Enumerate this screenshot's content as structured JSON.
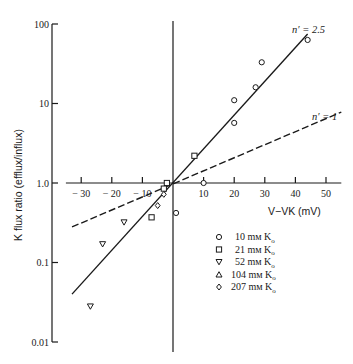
{
  "chart_data": {
    "type": "scatter",
    "title": "",
    "xlabel": "V−VK (mV)",
    "ylabel": "K flux ratio (efflux/influx)",
    "yscale": "log",
    "xlim": [
      -35,
      55
    ],
    "ylim": [
      0.01,
      100
    ],
    "x_ticks": [
      -30,
      -20,
      -10,
      10,
      20,
      30,
      40,
      50
    ],
    "x_tick_labels": [
      "− 30",
      "− 20",
      "− 10",
      "10",
      "20",
      "30",
      "40",
      "50"
    ],
    "y_ticks": [
      0.01,
      0.1,
      1.0,
      10,
      100
    ],
    "y_tick_labels": [
      "0.01",
      "0.1",
      "1.0",
      "10",
      "100"
    ],
    "grid": false,
    "legend_position": "lower right",
    "series": [
      {
        "name": "10 mM Ko",
        "label": "10 mм K",
        "sub": "o",
        "marker": "circle",
        "points": [
          [
            44,
            63
          ],
          [
            29,
            33
          ],
          [
            27,
            16
          ],
          [
            20,
            11
          ],
          [
            20,
            5.7
          ],
          [
            10,
            1.0
          ],
          [
            1,
            0.42
          ]
        ]
      },
      {
        "name": "21 mM Ko",
        "label": "21 mм K",
        "sub": "o",
        "marker": "square",
        "points": [
          [
            7,
            2.2
          ],
          [
            -2,
            1.0
          ],
          [
            -3,
            0.85
          ],
          [
            -7,
            0.37
          ]
        ]
      },
      {
        "name": "52 mM Ko",
        "label": "52 mм K",
        "sub": "o",
        "marker": "triangle-down",
        "points": [
          [
            -16,
            0.32
          ],
          [
            -23,
            0.17
          ],
          [
            -27,
            0.028
          ]
        ]
      },
      {
        "name": "104 mM Ko",
        "label": "104 mм K",
        "sub": "o",
        "marker": "triangle-up",
        "points": []
      },
      {
        "name": "207 mM Ko",
        "label": "207 mм K",
        "sub": "o",
        "marker": "diamond",
        "points": [
          [
            -5,
            0.52
          ],
          [
            -3,
            0.72
          ]
        ]
      }
    ],
    "lines": [
      {
        "name": "n' = 2.5",
        "style": "solid",
        "x": [
          -33,
          44
        ],
        "y": [
          0.04,
          75
        ]
      },
      {
        "name": "n' = 1",
        "style": "dashed",
        "x": [
          -33,
          55
        ],
        "y": [
          0.28,
          7.8
        ]
      }
    ],
    "annotations": [
      {
        "text": "n′ = 2.5",
        "near": "upper end of solid line"
      },
      {
        "text": "n′ = 1",
        "near": "right end of dashed line"
      }
    ]
  }
}
